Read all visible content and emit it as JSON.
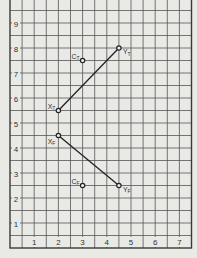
{
  "chart_data": {
    "type": "line",
    "title": "",
    "xlabel": "",
    "ylabel": "",
    "xlim": [
      0,
      7.5
    ],
    "ylim": [
      0,
      9.9
    ],
    "grid": true,
    "grid_step": 0.5,
    "x_ticks": [
      1,
      2,
      3,
      4,
      5,
      6,
      7
    ],
    "y_ticks": [
      1,
      2,
      3,
      4,
      5,
      6,
      7,
      8,
      9
    ],
    "series": [
      {
        "name": "T",
        "points": [
          {
            "label": "X",
            "sub": "T",
            "x": 2,
            "y": 5.5
          },
          {
            "label": "Y",
            "sub": "T",
            "x": 4.5,
            "y": 8
          }
        ],
        "connected": true
      },
      {
        "name": "F",
        "points": [
          {
            "label": "X",
            "sub": "F",
            "x": 2,
            "y": 4.5
          },
          {
            "label": "Y",
            "sub": "F",
            "x": 4.5,
            "y": 2.5
          }
        ],
        "connected": true
      }
    ],
    "standalone_points": [
      {
        "label": "C",
        "sub": "T",
        "x": 3,
        "y": 7.5
      },
      {
        "label": "C",
        "sub": "F",
        "x": 3,
        "y": 2.5
      }
    ],
    "colors": {
      "background": "#e9e9e6",
      "grid": "#555555",
      "line": "#222222"
    }
  }
}
